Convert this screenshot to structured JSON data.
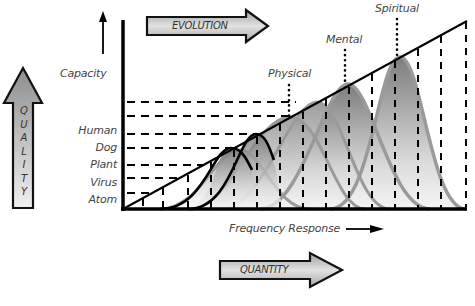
{
  "diagram": {
    "arrows": {
      "evolution": "EVOLUTION",
      "quality": "QUALITY",
      "quantity": "QUANTITY"
    },
    "axes": {
      "y_label": "Capacity",
      "x_label": "Frequency Response"
    },
    "levels": [
      "Human",
      "Dog",
      "Plant",
      "Virus",
      "Atom"
    ],
    "peak_labels": {
      "physical": "Physical",
      "mental": "Mental",
      "spiritual": "Spiritual"
    },
    "colors": {
      "line": "#000000",
      "curve_gray": "#9a9a9a",
      "fill_dark": "#7a7a7a",
      "arrow_fill_light": "#ececec",
      "arrow_fill_dark": "#b4b4b4"
    }
  }
}
